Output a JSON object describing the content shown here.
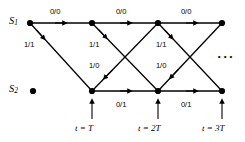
{
  "figure": {
    "type": "trellis-diagram",
    "width": 245,
    "height": 142,
    "background": "#ffffff",
    "ink_color": "#000000"
  },
  "states": [
    {
      "name": "state-s1",
      "label": "S",
      "subscript": "1",
      "row": "top",
      "x": 30,
      "y": 23
    },
    {
      "name": "state-s2",
      "label": "S",
      "subscript": "2",
      "row": "bottom",
      "x": 33,
      "y": 91
    }
  ],
  "nodes": {
    "top": [
      {
        "id": "t0",
        "x": 30,
        "y": 23
      },
      {
        "id": "t1",
        "x": 92,
        "y": 23
      },
      {
        "id": "t2",
        "x": 158,
        "y": 23
      },
      {
        "id": "t3",
        "x": 222,
        "y": 23
      }
    ],
    "bottom": [
      {
        "id": "b0",
        "x": 33,
        "y": 91,
        "isolated": true
      },
      {
        "id": "b1",
        "x": 92,
        "y": 91
      },
      {
        "id": "b2",
        "x": 158,
        "y": 91
      },
      {
        "id": "b3",
        "x": 222,
        "y": 91
      }
    ]
  },
  "edges": [
    {
      "id": "e-top-0",
      "from": "t0",
      "to": "t1",
      "label": "0/0",
      "kind": "horizontal-top"
    },
    {
      "id": "e-top-1",
      "from": "t1",
      "to": "t2",
      "label": "0/0",
      "kind": "horizontal-top"
    },
    {
      "id": "e-top-2",
      "from": "t2",
      "to": "t3",
      "label": "0/0",
      "kind": "horizontal-top"
    },
    {
      "id": "e-down-0",
      "from": "t0",
      "to": "b1",
      "label": "1/1",
      "kind": "diagonal-down"
    },
    {
      "id": "e-down-1",
      "from": "t1",
      "to": "b2",
      "label": "1/1",
      "kind": "diagonal-down"
    },
    {
      "id": "e-down-2",
      "from": "t2",
      "to": "b3",
      "label": "1/1",
      "kind": "diagonal-down"
    },
    {
      "id": "e-up-0",
      "from": "b1",
      "to": "t2",
      "label": "1/0",
      "kind": "diagonal-up"
    },
    {
      "id": "e-up-1",
      "from": "b2",
      "to": "t3",
      "label": "1/0",
      "kind": "diagonal-up"
    },
    {
      "id": "e-bot-0",
      "from": "b1",
      "to": "b2",
      "label": "0/1",
      "kind": "horizontal-bottom"
    },
    {
      "id": "e-bot-1",
      "from": "b2",
      "to": "b3",
      "label": "0/1",
      "kind": "horizontal-bottom"
    }
  ],
  "edge_labels": {
    "top": [
      {
        "text": "0/0",
        "x": 61,
        "y": 9
      },
      {
        "text": "0/0",
        "x": 126,
        "y": 9
      },
      {
        "text": "0/0",
        "x": 192,
        "y": 9
      }
    ],
    "one_one": [
      {
        "text": "1/1",
        "x": 31,
        "y": 45
      },
      {
        "text": "1/1",
        "x": 96,
        "y": 45
      },
      {
        "text": "1/1",
        "x": 163,
        "y": 45
      }
    ],
    "one_zero": [
      {
        "text": "1/0",
        "x": 96,
        "y": 66
      },
      {
        "text": "1/0",
        "x": 163,
        "y": 66
      }
    ],
    "bottom": [
      {
        "text": "0/1",
        "x": 126,
        "y": 105
      },
      {
        "text": "0/1",
        "x": 192,
        "y": 105
      }
    ]
  },
  "time_markers": [
    {
      "id": "tm-1",
      "label": "t = T",
      "tick_x": 92,
      "label_x": 92,
      "label_y": 129
    },
    {
      "id": "tm-2",
      "label": "t = 2T",
      "tick_x": 158,
      "label_x": 158,
      "label_y": 129
    },
    {
      "id": "tm-3",
      "label": "t = 3T",
      "tick_x": 222,
      "label_x": 222,
      "label_y": 129
    }
  ],
  "continuation": {
    "name": "ellipsis",
    "text": "···",
    "x": 228,
    "y": 57
  }
}
